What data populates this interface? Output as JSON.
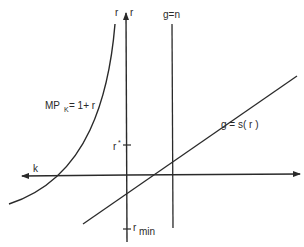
{
  "diagram": {
    "type": "economic-growth-diagram",
    "axes": {
      "horizontal_label": "k",
      "vertical_label_left": "r",
      "vertical_label_right": "r"
    },
    "curves": {
      "mpk": {
        "label_main": "MP",
        "label_sub": "K",
        "label_rest": " = 1+ r"
      },
      "saving": {
        "label": "g = s( r )"
      },
      "population": {
        "label": "g=n"
      }
    },
    "ticks": {
      "r_star": {
        "label_main": "r",
        "label_sup": "*"
      },
      "r_min": {
        "label_main": "r",
        "label_sub": "min"
      }
    },
    "colors": {
      "ink": "#2a2a2a",
      "background": "#ffffff"
    }
  }
}
